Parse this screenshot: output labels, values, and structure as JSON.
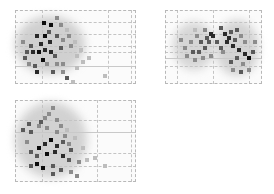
{
  "figure": {
    "type": "glass-brain maximum intensity projection",
    "background": "#ffffff",
    "grid_color": "#c4c4c4",
    "voxel_colormap": [
      "#e6e6e6",
      "#bdbdbd",
      "#8c8c8c",
      "#5a5a5a",
      "#2a2a2a",
      "#0d0d0d"
    ]
  },
  "panels": [
    {
      "id": "sagittal",
      "x": 15,
      "y": 10,
      "w": 121,
      "h": 74,
      "vlines": [
        27,
        93,
        116
      ],
      "hlines": [
        12,
        24,
        36,
        42,
        56
      ],
      "solid_h": [
        56
      ],
      "haze": [
        {
          "x": 0,
          "y": 6,
          "w": 70,
          "h": 58,
          "c": "#d0d0d0"
        }
      ],
      "voxels": [
        [
          27,
          11,
          5
        ],
        [
          34,
          13,
          5
        ],
        [
          40,
          6,
          2
        ],
        [
          44,
          13,
          2
        ],
        [
          50,
          18,
          1
        ],
        [
          46,
          28,
          2
        ],
        [
          20,
          24,
          4
        ],
        [
          28,
          24,
          5
        ],
        [
          33,
          30,
          4
        ],
        [
          24,
          32,
          4
        ],
        [
          14,
          34,
          3
        ],
        [
          10,
          40,
          3
        ],
        [
          8,
          46,
          3
        ],
        [
          16,
          40,
          4
        ],
        [
          22,
          40,
          5
        ],
        [
          28,
          38,
          4
        ],
        [
          34,
          40,
          4
        ],
        [
          38,
          44,
          3
        ],
        [
          26,
          48,
          5
        ],
        [
          18,
          54,
          3
        ],
        [
          12,
          52,
          2
        ],
        [
          30,
          52,
          2
        ],
        [
          40,
          52,
          2
        ],
        [
          46,
          52,
          2
        ],
        [
          20,
          60,
          4
        ],
        [
          36,
          60,
          3
        ],
        [
          46,
          60,
          2
        ],
        [
          50,
          66,
          3
        ],
        [
          56,
          70,
          1
        ],
        [
          60,
          56,
          1
        ],
        [
          44,
          36,
          3
        ],
        [
          54,
          34,
          2
        ],
        [
          60,
          44,
          1
        ],
        [
          66,
          50,
          1
        ],
        [
          72,
          46,
          1
        ],
        [
          88,
          64,
          1
        ],
        [
          6,
          30,
          2
        ],
        [
          40,
          24,
          3
        ],
        [
          52,
          24,
          2
        ],
        [
          58,
          30,
          1
        ],
        [
          64,
          38,
          1
        ],
        [
          32,
          20,
          3
        ]
      ]
    },
    {
      "id": "coronal",
      "x": 165,
      "y": 10,
      "w": 97,
      "h": 74,
      "vlines": [
        12,
        48,
        84
      ],
      "hlines": [
        12,
        24,
        36,
        42,
        48,
        56
      ],
      "solid_h": [
        48
      ],
      "haze": [
        {
          "x": 8,
          "y": 12,
          "w": 42,
          "h": 48,
          "c": "#d6d6d6"
        },
        {
          "x": 50,
          "y": 10,
          "w": 44,
          "h": 56,
          "c": "#d3d3d3"
        }
      ],
      "voxels": [
        [
          18,
          36,
          2
        ],
        [
          24,
          30,
          2
        ],
        [
          30,
          24,
          2
        ],
        [
          34,
          30,
          3
        ],
        [
          40,
          26,
          3
        ],
        [
          44,
          22,
          4
        ],
        [
          20,
          44,
          2
        ],
        [
          26,
          40,
          3
        ],
        [
          32,
          40,
          3
        ],
        [
          38,
          36,
          3
        ],
        [
          42,
          30,
          3
        ],
        [
          46,
          24,
          4
        ],
        [
          28,
          48,
          2
        ],
        [
          36,
          46,
          2
        ],
        [
          44,
          44,
          2
        ],
        [
          14,
          28,
          2
        ],
        [
          38,
          18,
          2
        ],
        [
          28,
          18,
          1
        ],
        [
          54,
          16,
          3
        ],
        [
          58,
          22,
          4
        ],
        [
          62,
          26,
          4
        ],
        [
          64,
          20,
          3
        ],
        [
          70,
          18,
          3
        ],
        [
          74,
          24,
          2
        ],
        [
          60,
          30,
          4
        ],
        [
          66,
          34,
          4
        ],
        [
          72,
          38,
          4
        ],
        [
          78,
          42,
          4
        ],
        [
          82,
          46,
          5
        ],
        [
          86,
          40,
          3
        ],
        [
          70,
          46,
          3
        ],
        [
          76,
          52,
          2
        ],
        [
          64,
          50,
          3
        ],
        [
          74,
          60,
          3
        ],
        [
          82,
          58,
          2
        ],
        [
          66,
          58,
          2
        ],
        [
          56,
          40,
          2
        ],
        [
          88,
          30,
          2
        ],
        [
          50,
          30,
          3
        ],
        [
          54,
          36,
          3
        ],
        [
          78,
          30,
          2
        ],
        [
          68,
          28,
          3
        ]
      ]
    },
    {
      "id": "axial",
      "x": 15,
      "y": 100,
      "w": 121,
      "h": 82,
      "vlines": [
        27,
        82,
        116
      ],
      "hlines": [
        20,
        32,
        53,
        66
      ],
      "solid_h": [
        32
      ],
      "haze": [
        {
          "x": 0,
          "y": 2,
          "w": 72,
          "h": 76,
          "c": "#d2d2d2"
        }
      ],
      "voxels": [
        [
          36,
          6,
          2
        ],
        [
          32,
          12,
          2
        ],
        [
          28,
          16,
          2
        ],
        [
          40,
          18,
          2
        ],
        [
          24,
          20,
          3
        ],
        [
          12,
          22,
          3
        ],
        [
          6,
          28,
          3
        ],
        [
          14,
          30,
          3
        ],
        [
          22,
          24,
          2
        ],
        [
          30,
          26,
          2
        ],
        [
          44,
          24,
          2
        ],
        [
          50,
          28,
          1
        ],
        [
          34,
          38,
          5
        ],
        [
          28,
          42,
          4
        ],
        [
          22,
          46,
          5
        ],
        [
          40,
          44,
          4
        ],
        [
          46,
          40,
          3
        ],
        [
          52,
          42,
          2
        ],
        [
          14,
          50,
          3
        ],
        [
          20,
          54,
          3
        ],
        [
          30,
          52,
          5
        ],
        [
          38,
          50,
          4
        ],
        [
          46,
          54,
          4
        ],
        [
          52,
          58,
          3
        ],
        [
          20,
          62,
          5
        ],
        [
          26,
          66,
          5
        ],
        [
          36,
          64,
          3
        ],
        [
          44,
          68,
          3
        ],
        [
          54,
          70,
          2
        ],
        [
          60,
          74,
          2
        ],
        [
          14,
          64,
          3
        ],
        [
          36,
          72,
          3
        ],
        [
          62,
          60,
          2
        ],
        [
          70,
          58,
          1
        ],
        [
          78,
          56,
          1
        ],
        [
          88,
          64,
          1
        ],
        [
          48,
          34,
          2
        ],
        [
          58,
          36,
          1
        ],
        [
          66,
          46,
          1
        ],
        [
          40,
          30,
          2
        ],
        [
          10,
          40,
          2
        ],
        [
          54,
          48,
          3
        ]
      ]
    }
  ]
}
